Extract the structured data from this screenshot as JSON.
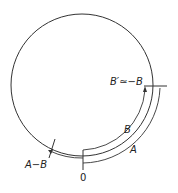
{
  "diagram": {
    "type": "circular phase/arc diagram",
    "labels": {
      "origin": "0",
      "arc_a": "A",
      "arc_b": "B",
      "b_prime": "B′≃−B",
      "a_minus_b": "A−B"
    },
    "colors": {
      "stroke": "#333333",
      "background": "#ffffff"
    }
  }
}
